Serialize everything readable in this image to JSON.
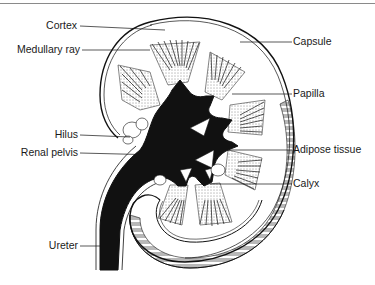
{
  "figure": {
    "colors": {
      "ink": "#111111",
      "background": "#ffffff",
      "rule": "#8a8a8a"
    }
  },
  "labels_left": [
    {
      "id": "cortex",
      "text": "Cortex"
    },
    {
      "id": "medullary-ray",
      "text": "Medullary ray"
    },
    {
      "id": "hilus",
      "text": "Hilus"
    },
    {
      "id": "renal-pelvis",
      "text": "Renal pelvis"
    },
    {
      "id": "ureter",
      "text": "Ureter"
    }
  ],
  "labels_right": [
    {
      "id": "capsule",
      "text": "Capsule"
    },
    {
      "id": "papilla",
      "text": "Papilla"
    },
    {
      "id": "adipose-tissue",
      "text": "Adipose tissue"
    },
    {
      "id": "calyx",
      "text": "Calyx"
    }
  ]
}
